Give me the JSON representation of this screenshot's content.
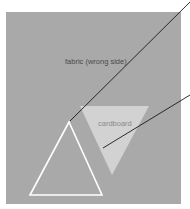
{
  "diagram": {
    "labels": {
      "fabric": "fabric (wrong side)",
      "cardboard": "cardboard"
    },
    "colors": {
      "background": "#ffffff",
      "fabric": "#a9a9a9",
      "cardboard": "#d2d2d2",
      "outline": "#ffffff",
      "leader": "#1a1a1a",
      "fabric_text": "#4a4a4a",
      "cardboard_text": "#8a8a8a"
    }
  }
}
